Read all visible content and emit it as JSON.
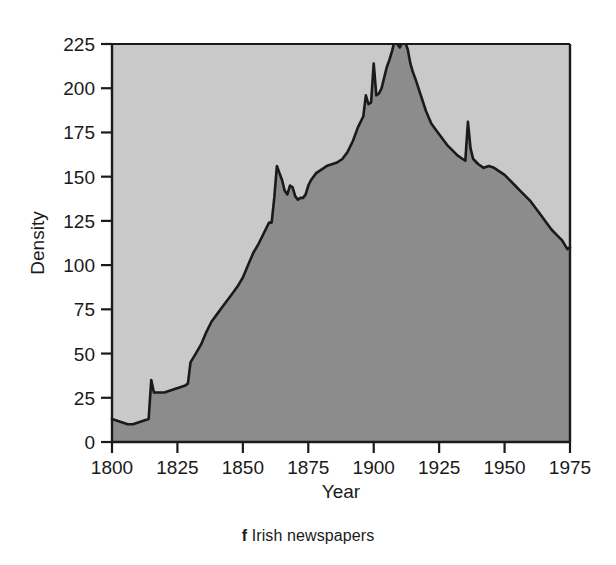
{
  "caption": {
    "panel_letter": "f",
    "text": "Irish newspapers"
  },
  "chart_data": {
    "type": "area",
    "title": "",
    "xlabel": "Year",
    "ylabel": "Density",
    "xlim": [
      1800,
      1975
    ],
    "ylim": [
      0,
      230
    ],
    "xticks": [
      1800,
      1825,
      1850,
      1875,
      1900,
      1925,
      1950,
      1975
    ],
    "xticklabels": [
      "1800",
      "1825",
      "1850",
      "1875",
      "1900",
      "1925",
      "1950",
      "1975"
    ],
    "yticks": [
      0,
      25,
      50,
      75,
      100,
      125,
      150,
      175,
      200,
      225
    ],
    "yticklabels": [
      "0",
      "25",
      "50",
      "75",
      "100",
      "125",
      "150",
      "175",
      "200",
      "225"
    ],
    "grid": false,
    "legend": null,
    "plot_bgcolor": "#c9c9c9",
    "fill_color": "#8c8c8c",
    "line_color": "#1a1a1a",
    "axis_color": "#1a1a1a",
    "series": [
      {
        "name": "Density",
        "x": [
          1800,
          1802,
          1804,
          1806,
          1808,
          1810,
          1812,
          1814,
          1815,
          1816,
          1818,
          1820,
          1822,
          1824,
          1826,
          1828,
          1829,
          1830,
          1832,
          1834,
          1836,
          1838,
          1840,
          1842,
          1844,
          1846,
          1848,
          1850,
          1852,
          1854,
          1856,
          1858,
          1860,
          1861,
          1862,
          1863,
          1864,
          1865,
          1866,
          1867,
          1868,
          1869,
          1870,
          1871,
          1872,
          1873,
          1874,
          1875,
          1876,
          1878,
          1880,
          1882,
          1884,
          1886,
          1888,
          1890,
          1892,
          1894,
          1896,
          1897,
          1898,
          1899,
          1900,
          1901,
          1902,
          1903,
          1904,
          1905,
          1906,
          1907,
          1908,
          1909,
          1910,
          1911,
          1912,
          1913,
          1914,
          1915,
          1916,
          1918,
          1920,
          1922,
          1924,
          1926,
          1928,
          1930,
          1932,
          1934,
          1935,
          1936,
          1937,
          1938,
          1940,
          1942,
          1944,
          1946,
          1948,
          1950,
          1952,
          1954,
          1956,
          1958,
          1960,
          1962,
          1964,
          1966,
          1968,
          1970,
          1972,
          1974,
          1975
        ],
        "y": [
          13,
          12,
          11,
          10,
          10,
          11,
          12,
          13,
          35,
          28,
          28,
          28,
          29,
          30,
          31,
          32,
          33,
          45,
          50,
          55,
          62,
          68,
          72,
          76,
          80,
          84,
          88,
          93,
          100,
          107,
          112,
          118,
          124,
          124,
          138,
          156,
          152,
          148,
          142,
          140,
          145,
          144,
          139,
          137,
          138,
          138,
          140,
          145,
          148,
          152,
          154,
          156,
          157,
          158,
          160,
          164,
          170,
          178,
          184,
          196,
          191,
          192,
          214,
          196,
          197,
          200,
          206,
          212,
          216,
          221,
          227,
          225,
          223,
          227,
          226,
          222,
          214,
          209,
          205,
          196,
          187,
          180,
          176,
          172,
          168,
          165,
          162,
          160,
          159,
          181,
          166,
          160,
          157,
          155,
          156,
          155,
          153,
          151,
          148,
          145,
          142,
          139,
          136,
          132,
          128,
          124,
          120,
          117,
          114,
          109,
          110
        ]
      }
    ]
  }
}
